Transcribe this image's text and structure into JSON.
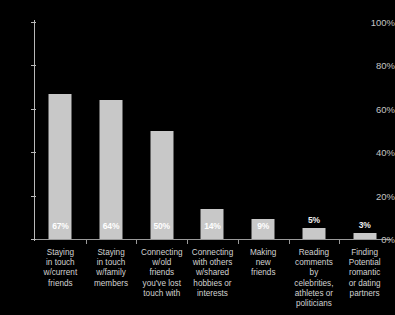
{
  "chart_data": {
    "type": "bar",
    "title": "",
    "xlabel": "",
    "ylabel": "",
    "ylim": [
      0,
      100
    ],
    "grid": false,
    "legend": false,
    "categories": [
      "Staying\nin touch\nw/current\nfriends",
      "Staying\nin touch\nw/family\nmembers",
      "Connecting\nw/old\nfriends\nyou've lost\ntouch with",
      "Connecting\nwith others\nw/shared\nhobbies or\ninterests",
      "Making\nnew\nfriends",
      "Reading\ncomments\nby\ncelebrities,\nathletes or\npoliticians",
      "Finding\nPotential\nromantic\nor dating\npartners"
    ],
    "values": [
      67,
      64,
      50,
      14,
      9,
      5,
      3
    ],
    "value_labels": [
      "67%",
      "64%",
      "50%",
      "14%",
      "9%",
      "5%",
      "3%"
    ],
    "y_ticks": [
      0,
      20,
      40,
      60,
      80,
      100
    ],
    "y_tick_labels": [
      "0%",
      "20%",
      "40%",
      "60%",
      "80%",
      "100%"
    ]
  },
  "style": {
    "background": "#000000",
    "bar_color": "#c8c8c8",
    "axis_color": "#b9b9b9",
    "text_color": "#d2d2d2",
    "value_label_color": "#ffffff"
  }
}
